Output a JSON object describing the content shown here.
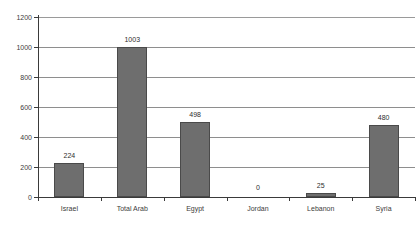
{
  "chart_data": {
    "type": "bar",
    "title": "",
    "subtitle": "",
    "xlabel": "",
    "ylabel": "",
    "categories": [
      "Israel",
      "Total Arab",
      "Egypt",
      "Jordan",
      "Lebanon",
      "Syria"
    ],
    "values": [
      224,
      1003,
      498,
      0,
      25,
      480
    ],
    "value_labels": [
      "224",
      "1003",
      "498",
      "0",
      "25",
      "480"
    ],
    "ylim": [
      0,
      1200
    ],
    "ytick_values": [
      0,
      200,
      400,
      600,
      800,
      1000,
      1200
    ],
    "ytick_labels": [
      "0",
      "200",
      "400",
      "600",
      "800",
      "1000",
      "1200"
    ],
    "grid": true,
    "grid_axis": "y",
    "legend": false,
    "legend_position": "none",
    "bar_color": "#6e6e6e",
    "bar_edge_color": "#4a4a4a",
    "grid_color": "#8e8e8e",
    "axis_color": "#3a3a3a",
    "background_color": "#ffffff",
    "text_color": "#3c3c3c"
  }
}
